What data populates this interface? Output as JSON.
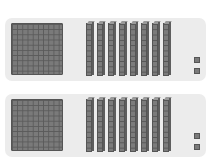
{
  "diagram": {
    "type": "base-ten-blocks",
    "panels": [
      {
        "hundreds": 1,
        "tens": 8,
        "ones": 2,
        "value": 182
      },
      {
        "hundreds": 1,
        "tens": 8,
        "ones": 2,
        "value": 182
      }
    ],
    "colors": {
      "panel_bg": "#ececec",
      "block": "#7a7a7a",
      "block_line": "#555555"
    }
  }
}
